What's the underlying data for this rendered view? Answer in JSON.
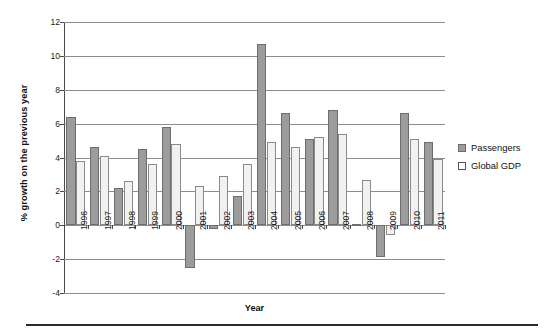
{
  "chart_data": {
    "type": "bar",
    "title": "",
    "xlabel": "Year",
    "ylabel": "% growth on the previous year",
    "categories": [
      "1996",
      "1997",
      "1998",
      "1999",
      "2000",
      "2001",
      "2002",
      "2003",
      "2004",
      "2005",
      "2006",
      "2007",
      "2008",
      "2009",
      "2010",
      "2011"
    ],
    "series": [
      {
        "name": "Passengers",
        "color": "#9c9c9c",
        "values": [
          6.4,
          4.6,
          2.2,
          4.5,
          5.8,
          -2.5,
          -0.2,
          1.7,
          10.7,
          6.6,
          5.1,
          6.8,
          0.1,
          -1.9,
          6.6,
          4.9
        ]
      },
      {
        "name": "Global GDP",
        "color": "#f1f1f1",
        "values": [
          3.8,
          4.1,
          2.6,
          3.6,
          4.8,
          2.3,
          2.9,
          3.6,
          4.9,
          4.6,
          5.2,
          5.4,
          2.7,
          -0.6,
          5.1,
          3.9
        ]
      }
    ],
    "ylim": [
      -4,
      12
    ],
    "yticks": [
      12,
      10,
      8,
      6,
      4,
      2,
      0,
      -2,
      -4
    ],
    "ytick_labels": [
      "12",
      "10",
      "8",
      "6",
      "4",
      "2",
      "0",
      "-2",
      "-4"
    ],
    "grid": true,
    "legend_position": "right"
  },
  "legend": {
    "items": [
      {
        "label": "Passengers",
        "swatch": "passengers"
      },
      {
        "label": "Global GDP",
        "swatch": "gdp"
      }
    ]
  },
  "axes": {
    "x_title": "Year",
    "y_title": "% growth on the previous year"
  }
}
